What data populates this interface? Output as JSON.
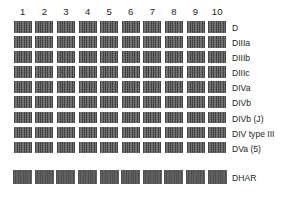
{
  "figure": {
    "type": "gel-blot-panel",
    "background_color": "#ffffff",
    "band_color": "#58585a",
    "text_color": "#231f20"
  },
  "columns": {
    "headers": [
      "1",
      "2",
      "3",
      "4",
      "5",
      "6",
      "7",
      "8",
      "9",
      "10"
    ],
    "count": 10
  },
  "rows": [
    {
      "label": "D",
      "bands": 10
    },
    {
      "label": "DIIIa",
      "bands": 10
    },
    {
      "label": "DIIIb",
      "bands": 10
    },
    {
      "label": "DIIIc",
      "bands": 10
    },
    {
      "label": "DIVa",
      "bands": 10
    },
    {
      "label": "DIVb",
      "bands": 10
    },
    {
      "label": "DIVb (J)",
      "bands": 10
    },
    {
      "label": "DIV type III",
      "bands": 10
    },
    {
      "label": "DVa (5)",
      "bands": 10
    }
  ],
  "control_row": {
    "label": "DHAR",
    "bands": 10
  }
}
